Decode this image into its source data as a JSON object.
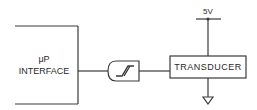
{
  "diagram": {
    "blocks": {
      "interface": {
        "line1": "μP",
        "line2": "INTERFACE"
      },
      "gate": {
        "type": "schmitt-trigger"
      },
      "transducer": {
        "label": "TRANSDUCER"
      }
    },
    "supply": {
      "label": "5V"
    },
    "ground": {
      "symbol": "ground"
    }
  },
  "colors": {
    "line": "#3a3a3a",
    "text": "#2a2a2a",
    "background": "#ffffff"
  }
}
